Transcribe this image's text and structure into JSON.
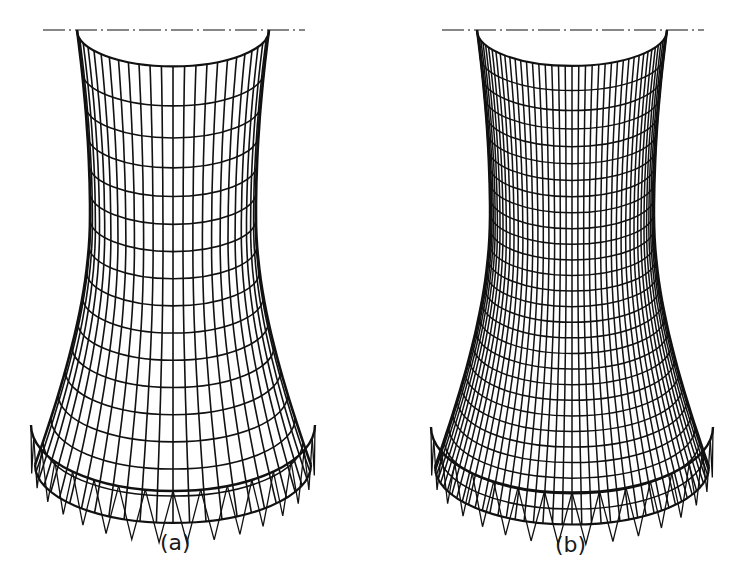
{
  "figure": {
    "panels": [
      {
        "id": "a",
        "label": "(a)",
        "mesh": "coarse",
        "cx": 173,
        "top_y": 30,
        "throat_y": 215,
        "bottom_y": 465,
        "top_half_width": 96,
        "throat_half_width": 83,
        "bottom_half_width": 138,
        "meridians": 26,
        "rings": 16,
        "supports": 16,
        "stroke": 1.6
      },
      {
        "id": "b",
        "label": "(b)",
        "mesh": "fine",
        "cx": 572,
        "top_y": 30,
        "throat_y": 215,
        "bottom_y": 467,
        "top_half_width": 95,
        "throat_half_width": 82,
        "bottom_half_width": 137,
        "meridians": 44,
        "rings": 28,
        "supports": 16,
        "stroke": 1.5
      }
    ],
    "axis_line": "dash-dot",
    "line_color": "#111111"
  }
}
